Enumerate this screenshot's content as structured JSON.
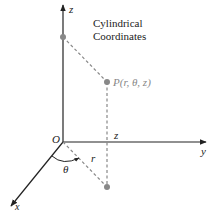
{
  "diagram": {
    "title_line1": "Cylindrical",
    "title_line2": "Coordinates",
    "axes": {
      "z": "z",
      "y": "y",
      "x": "x"
    },
    "origin_label": "O",
    "point_label": "P(r, θ, z)",
    "height_label": "z",
    "radius_label": "r",
    "angle_label": "θ",
    "colors": {
      "axis": "#222222",
      "dashed": "#888888",
      "point": "#888888",
      "point_label": "#888888"
    }
  }
}
